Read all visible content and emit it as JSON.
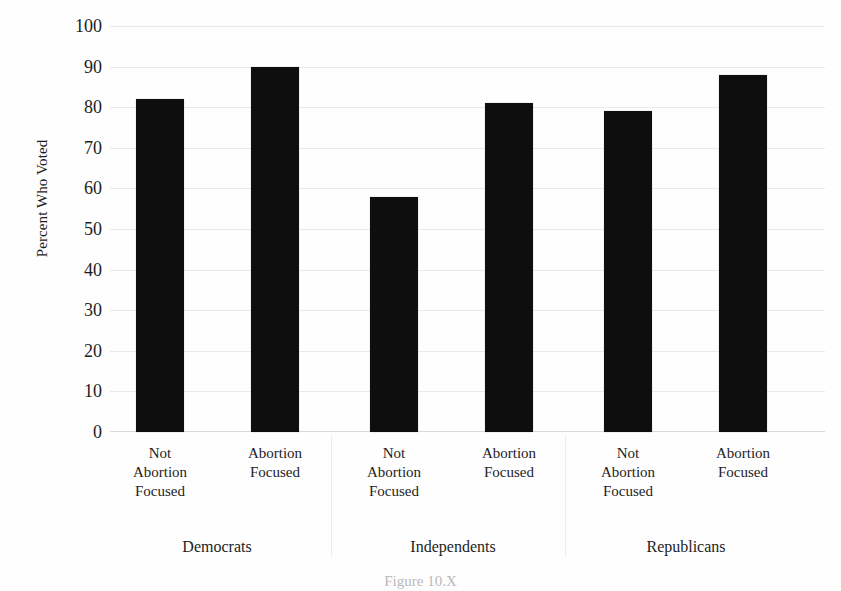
{
  "chart_data": {
    "type": "bar",
    "title": "",
    "xlabel": "",
    "ylabel": "Percent Who Voted",
    "ylim": [
      0,
      100
    ],
    "ytick_step": 10,
    "grid": true,
    "legend": "none",
    "bar_color": "#0e0e0e",
    "categories": [
      "Not\nAbortion\nFocused",
      "Abortion\nFocused",
      "Not\nAbortion\nFocused",
      "Abortion\nFocused",
      "Not\nAbortion\nFocused",
      "Abortion\nFocused"
    ],
    "values": [
      82,
      90,
      58,
      81,
      79,
      88
    ],
    "groups": [
      {
        "name": "Democrats",
        "categories": [
          "Not Abortion Focused",
          "Abortion Focused"
        ],
        "values": [
          82,
          90
        ]
      },
      {
        "name": "Independents",
        "categories": [
          "Not Abortion Focused",
          "Abortion Focused"
        ],
        "values": [
          58,
          81
        ]
      },
      {
        "name": "Republicans",
        "categories": [
          "Not Abortion Focused",
          "Abortion Focused"
        ],
        "values": [
          79,
          88
        ]
      }
    ],
    "ytick_labels": [
      "100",
      "90",
      "80",
      "70",
      "60",
      "50",
      "40",
      "30",
      "20",
      "10",
      "0"
    ]
  },
  "axis": {
    "y_title": "Percent Who Voted",
    "ticks": [
      {
        "label": "100",
        "value": 100
      },
      {
        "label": "90",
        "value": 90
      },
      {
        "label": "80",
        "value": 80
      },
      {
        "label": "70",
        "value": 70
      },
      {
        "label": "60",
        "value": 60
      },
      {
        "label": "50",
        "value": 50
      },
      {
        "label": "40",
        "value": 40
      },
      {
        "label": "30",
        "value": 30
      },
      {
        "label": "20",
        "value": 20
      },
      {
        "label": "10",
        "value": 10
      },
      {
        "label": "0",
        "value": 0
      }
    ]
  },
  "x_labels": [
    {
      "line1": "Not",
      "line2": "Abortion",
      "line3": "Focused"
    },
    {
      "line1": "Abortion",
      "line2": "Focused",
      "line3": ""
    },
    {
      "line1": "Not",
      "line2": "Abortion",
      "line3": "Focused"
    },
    {
      "line1": "Abortion",
      "line2": "Focused",
      "line3": ""
    },
    {
      "line1": "Not",
      "line2": "Abortion",
      "line3": "Focused"
    },
    {
      "line1": "Abortion",
      "line2": "Focused",
      "line3": ""
    }
  ],
  "group_labels": [
    "Democrats",
    "Independents",
    "Republicans"
  ],
  "caption": {
    "text": "Figure 10.X"
  }
}
